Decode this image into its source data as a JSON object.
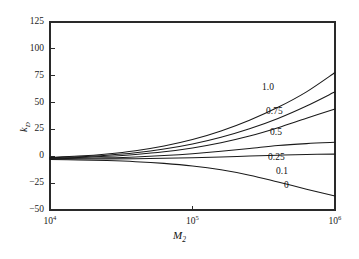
{
  "chart_data": {
    "type": "line",
    "title": "",
    "xlabel": "M₂",
    "xlabel_base": "M",
    "xlabel_sub": "2",
    "ylabel": "kₑ",
    "ylabel_base": "k",
    "ylabel_sub": "D",
    "xscale": "log",
    "yscale": "linear",
    "xlim": [
      10000,
      1000000
    ],
    "ylim": [
      -50,
      125
    ],
    "grid": false,
    "legend": "inline-curve-labels",
    "xticks": [
      10000,
      100000,
      1000000
    ],
    "xtick_labels": [
      "10⁴",
      "10⁵",
      "10⁶"
    ],
    "xtick_mantissas": [
      "10",
      "10",
      "10"
    ],
    "xtick_exponents": [
      "4",
      "5",
      "6"
    ],
    "yticks": [
      -50,
      -25,
      0,
      25,
      50,
      75,
      100,
      125
    ],
    "ytick_labels": [
      "−50",
      "−25",
      "0",
      "25",
      "50",
      "75",
      "100",
      "125"
    ],
    "x": [
      10000,
      15849,
      25119,
      39811,
      63096,
      100000,
      158489,
      251189,
      398107,
      630957,
      1000000
    ],
    "series": [
      {
        "name": "1.0",
        "label": "1.0",
        "values": [
          -1.0,
          0.2,
          2.2,
          5.2,
          9.6,
          15.6,
          23.6,
          33.6,
          45.6,
          60.0,
          78.0
        ]
      },
      {
        "name": "0.75",
        "label": "0.75",
        "values": [
          -1.4,
          -0.5,
          1.0,
          3.3,
          6.7,
          11.4,
          17.7,
          25.6,
          35.2,
          46.8,
          60.0
        ]
      },
      {
        "name": "0.5",
        "label": "0.5",
        "values": [
          -1.8,
          -1.1,
          0.0,
          1.7,
          4.2,
          7.8,
          12.6,
          18.8,
          26.6,
          35.4,
          44.0
        ]
      },
      {
        "name": "0.25",
        "label": "0.25",
        "values": [
          -2.2,
          -1.9,
          -1.4,
          -0.6,
          0.7,
          2.4,
          4.6,
          7.2,
          10.0,
          11.8,
          13.0
        ]
      },
      {
        "name": "0.1",
        "label": "0.1",
        "values": [
          -2.6,
          -2.5,
          -2.4,
          -2.2,
          -1.9,
          -1.4,
          -0.7,
          0.2,
          1.0,
          1.7,
          2.0
        ]
      },
      {
        "name": "0",
        "label": "0",
        "values": [
          -3.0,
          -3.4,
          -4.0,
          -5.0,
          -6.6,
          -9.0,
          -12.6,
          -17.6,
          -24.0,
          -30.6,
          -37.0
        ]
      }
    ],
    "curve_label_positions": [
      {
        "label": "1.0",
        "left": 262,
        "top": 83
      },
      {
        "label": "0.75",
        "left": 266,
        "top": 107
      },
      {
        "label": "0.5",
        "left": 270,
        "top": 128
      },
      {
        "label": "0.25",
        "left": 268,
        "top": 153
      },
      {
        "label": "0.1",
        "left": 276,
        "top": 167
      },
      {
        "label": "0",
        "left": 284,
        "top": 181
      }
    ]
  },
  "style": {
    "axis_color": "#2a2a2a",
    "curve_color": "#1a1a1a",
    "background": "#ffffff",
    "text_color": "#111111"
  },
  "geometry": {
    "plot_left": 50,
    "plot_right": 335,
    "plot_top": 22,
    "plot_bottom": 210
  }
}
